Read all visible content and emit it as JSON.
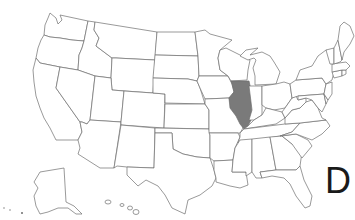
{
  "map": {
    "title": "United States",
    "highlighted_state": "Illinois",
    "highlight_color": "#7a7a7a",
    "outline_color": "#6e6e6e",
    "background_color": "#ffffff"
  },
  "label": {
    "text": "D"
  },
  "states": [
    {
      "name": "Washington"
    },
    {
      "name": "Oregon"
    },
    {
      "name": "California"
    },
    {
      "name": "Idaho"
    },
    {
      "name": "Nevada"
    },
    {
      "name": "Montana"
    },
    {
      "name": "Wyoming"
    },
    {
      "name": "Utah"
    },
    {
      "name": "Arizona"
    },
    {
      "name": "Colorado"
    },
    {
      "name": "New Mexico"
    },
    {
      "name": "North Dakota"
    },
    {
      "name": "South Dakota"
    },
    {
      "name": "Nebraska"
    },
    {
      "name": "Kansas"
    },
    {
      "name": "Oklahoma"
    },
    {
      "name": "Texas"
    },
    {
      "name": "Minnesota"
    },
    {
      "name": "Iowa"
    },
    {
      "name": "Missouri"
    },
    {
      "name": "Arkansas"
    },
    {
      "name": "Louisiana"
    },
    {
      "name": "Wisconsin"
    },
    {
      "name": "Illinois"
    },
    {
      "name": "Michigan"
    },
    {
      "name": "Indiana"
    },
    {
      "name": "Ohio"
    },
    {
      "name": "Kentucky"
    },
    {
      "name": "Tennessee"
    },
    {
      "name": "Mississippi"
    },
    {
      "name": "Alabama"
    },
    {
      "name": "Georgia"
    },
    {
      "name": "Florida"
    },
    {
      "name": "South Carolina"
    },
    {
      "name": "North Carolina"
    },
    {
      "name": "Virginia"
    },
    {
      "name": "West Virginia"
    },
    {
      "name": "Pennsylvania"
    },
    {
      "name": "New York"
    },
    {
      "name": "Maryland"
    },
    {
      "name": "Delaware"
    },
    {
      "name": "New Jersey"
    },
    {
      "name": "Connecticut"
    },
    {
      "name": "Rhode Island"
    },
    {
      "name": "Massachusetts"
    },
    {
      "name": "Vermont"
    },
    {
      "name": "New Hampshire"
    },
    {
      "name": "Maine"
    },
    {
      "name": "Alaska"
    },
    {
      "name": "Hawaii"
    }
  ]
}
